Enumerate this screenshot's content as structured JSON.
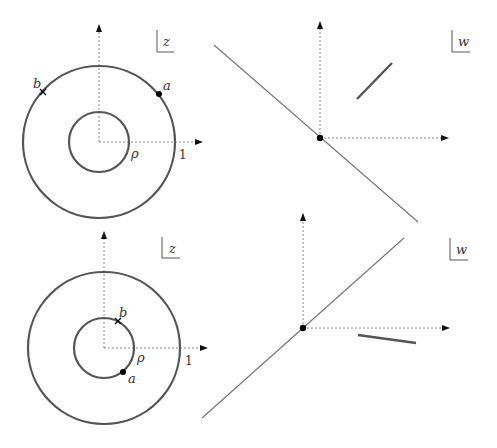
{
  "panels": {
    "top_left": {
      "plane_label": "z",
      "point_a_label": "a",
      "point_b_label": "b",
      "inner_radius_label": "ρ",
      "outer_radius_label": "1"
    },
    "top_right": {
      "plane_label": "w"
    },
    "bottom_left": {
      "plane_label": "z",
      "point_a_label": "a",
      "point_b_label": "b",
      "inner_radius_label": "ρ",
      "outer_radius_label": "1"
    },
    "bottom_right": {
      "plane_label": "w"
    }
  },
  "colors": {
    "circle": "#555555",
    "line": "#777777",
    "axis": "#888888",
    "point": "#000000"
  }
}
